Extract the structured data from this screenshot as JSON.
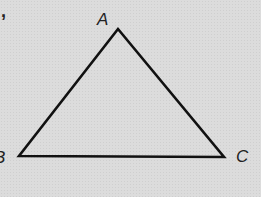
{
  "diagram": {
    "type": "triangle",
    "stroke_color": "#111111",
    "background_color": "#dcdcdc",
    "stray_mark": ",",
    "vertices": [
      {
        "name": "A",
        "x": 118,
        "y": 29,
        "label": "A",
        "label_x": 97,
        "label_y": 11
      },
      {
        "name": "B",
        "x": 19,
        "y": 156,
        "label": "B",
        "label_x": -6,
        "label_y": 149
      },
      {
        "name": "C",
        "x": 224,
        "y": 157,
        "label": "C",
        "label_x": 236,
        "label_y": 148
      }
    ],
    "edges": [
      "AB",
      "AC",
      "BC"
    ]
  }
}
